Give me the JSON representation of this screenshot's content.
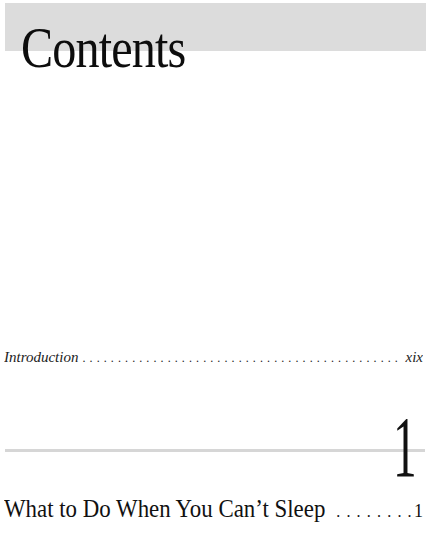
{
  "page": {
    "title": "Contents"
  },
  "toc": {
    "introduction": {
      "label": "Introduction",
      "leader": "................................................................................",
      "page": "xix"
    },
    "chapters": [
      {
        "number": "1",
        "title": "What to Do When You Can’t Sleep",
        "leader": "..........................................",
        "page": "1"
      }
    ]
  },
  "colors": {
    "header_band": "#dcdcdc",
    "rule": "#d6d6d6",
    "text": "#111111"
  }
}
